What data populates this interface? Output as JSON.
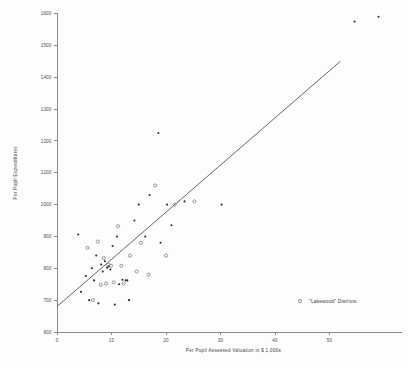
{
  "chart_data": {
    "type": "scatter",
    "title": "",
    "xlabel": "Per Pupil Assessed Valuation in $ 1,000s",
    "ylabel": "Per Pupil Expenditures",
    "xlim": [
      0,
      55
    ],
    "ylim": [
      600,
      1600
    ],
    "xticks": [
      0,
      10,
      20,
      30,
      40,
      50
    ],
    "xtick_labels": [
      "0",
      "10",
      "20",
      "30",
      "40",
      "50"
    ],
    "yticks": [
      600,
      700,
      800,
      900,
      1000,
      1100,
      1200,
      1300,
      1400,
      1500,
      1600
    ],
    "ytick_labels": [
      "600",
      "700",
      "800",
      "900",
      "1000",
      "1100",
      "1200",
      "1300",
      "1400",
      "1500",
      "1600"
    ],
    "grid": false,
    "legend_position": "bottom-right",
    "legend": [
      {
        "marker": "open-circle",
        "label": "\"Lakewood\" Districts"
      }
    ],
    "series": [
      {
        "name": "Districts (filled)",
        "marker": "filled-circle",
        "points": [
          {
            "x": 3.9,
            "y": 906
          },
          {
            "x": 4.4,
            "y": 726
          },
          {
            "x": 5.3,
            "y": 776
          },
          {
            "x": 5.9,
            "y": 700
          },
          {
            "x": 6.4,
            "y": 800
          },
          {
            "x": 6.8,
            "y": 762
          },
          {
            "x": 7.2,
            "y": 840
          },
          {
            "x": 7.6,
            "y": 690
          },
          {
            "x": 8.1,
            "y": 812
          },
          {
            "x": 8.4,
            "y": 790
          },
          {
            "x": 8.8,
            "y": 822
          },
          {
            "x": 9.2,
            "y": 802
          },
          {
            "x": 9.5,
            "y": 806
          },
          {
            "x": 9.8,
            "y": 796
          },
          {
            "x": 10.2,
            "y": 870
          },
          {
            "x": 10.6,
            "y": 686
          },
          {
            "x": 11.0,
            "y": 900
          },
          {
            "x": 11.4,
            "y": 750
          },
          {
            "x": 12.0,
            "y": 764
          },
          {
            "x": 12.6,
            "y": 762
          },
          {
            "x": 12.9,
            "y": 762
          },
          {
            "x": 13.2,
            "y": 700
          },
          {
            "x": 14.2,
            "y": 950
          },
          {
            "x": 15.0,
            "y": 1000
          },
          {
            "x": 16.2,
            "y": 900
          },
          {
            "x": 17.0,
            "y": 1030
          },
          {
            "x": 18.6,
            "y": 1225
          },
          {
            "x": 19.0,
            "y": 880
          },
          {
            "x": 20.2,
            "y": 1000
          },
          {
            "x": 21.0,
            "y": 935
          },
          {
            "x": 23.4,
            "y": 1010
          },
          {
            "x": 30.2,
            "y": 1000
          },
          {
            "x": 54.6,
            "y": 1575
          },
          {
            "x": 59.0,
            "y": 1590
          }
        ]
      },
      {
        "name": "\"Lakewood\" Districts",
        "marker": "open-circle",
        "points": [
          {
            "x": 5.6,
            "y": 864
          },
          {
            "x": 6.6,
            "y": 700
          },
          {
            "x": 7.5,
            "y": 884
          },
          {
            "x": 8.0,
            "y": 748
          },
          {
            "x": 8.6,
            "y": 832
          },
          {
            "x": 9.0,
            "y": 752
          },
          {
            "x": 9.4,
            "y": 812
          },
          {
            "x": 9.9,
            "y": 808
          },
          {
            "x": 10.4,
            "y": 756
          },
          {
            "x": 11.2,
            "y": 932
          },
          {
            "x": 11.8,
            "y": 808
          },
          {
            "x": 12.2,
            "y": 752
          },
          {
            "x": 13.4,
            "y": 840
          },
          {
            "x": 14.6,
            "y": 790
          },
          {
            "x": 15.4,
            "y": 880
          },
          {
            "x": 16.8,
            "y": 780
          },
          {
            "x": 18.0,
            "y": 1060
          },
          {
            "x": 20.0,
            "y": 840
          },
          {
            "x": 21.6,
            "y": 1000
          },
          {
            "x": 25.2,
            "y": 1010
          }
        ]
      }
    ],
    "trend_line": {
      "type": "linear-fit",
      "x_start": 0,
      "y_start": 680,
      "x_end": 52,
      "y_end": 1450
    }
  },
  "axes": {
    "x_title": "Per Pupil Assessed Valuation in $ 1,000s",
    "y_title": "Per Pupil Expenditures"
  }
}
